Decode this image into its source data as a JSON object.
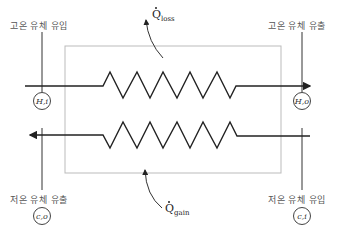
{
  "diagram": {
    "labels": {
      "hot_in": "고온 유체 유입",
      "hot_out": "고온 유체 유출",
      "cold_out": "저온 유체 유출",
      "cold_in": "저온 유체 유입"
    },
    "nodes": {
      "hot_in": "H,i",
      "hot_out": "H,o",
      "cold_out": "c,o",
      "cold_in": "c,i"
    },
    "heat": {
      "loss_symbol": "Q",
      "loss_sub": "loss",
      "gain_symbol": "Q",
      "gain_sub": "gain"
    },
    "colors": {
      "line": "#222222",
      "box": "#bbbbbb",
      "label": "#555555"
    }
  }
}
